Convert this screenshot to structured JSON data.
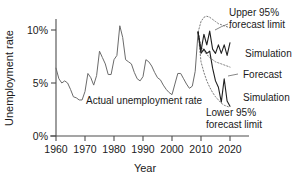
{
  "chart_data": {
    "type": "line",
    "title": "",
    "xlabel": "Year",
    "ylabel": "Unemployment rate",
    "xlim": [
      1958,
      2025
    ],
    "ylim": [
      0,
      11.6
    ],
    "grid": false,
    "legend_position": "inline-annotations",
    "x_tick_labels": [
      "1960",
      "1970",
      "1980",
      "1990",
      "2000",
      "2010",
      "2020"
    ],
    "x_ticks": [
      1960,
      1970,
      1980,
      1990,
      2000,
      2010,
      2020
    ],
    "y_tick_labels": [
      "0%",
      "5%",
      "10%"
    ],
    "y_ticks": [
      0,
      5,
      10
    ],
    "series": [
      {
        "name": "Actual unemployment rate",
        "style": "solid-gray",
        "x": [
          1960,
          1961,
          1962,
          1963,
          1964,
          1965,
          1966,
          1967,
          1968,
          1969,
          1970,
          1971,
          1972,
          1973,
          1974,
          1975,
          1976,
          1977,
          1978,
          1979,
          1980,
          1981,
          1982,
          1983,
          1984,
          1985,
          1986,
          1987,
          1988,
          1989,
          1990,
          1991,
          1992,
          1993,
          1994,
          1995,
          1996,
          1997,
          1998,
          1999,
          2000,
          2001,
          2002,
          2003,
          2004,
          2005,
          2006,
          2007,
          2008,
          2009
        ],
        "values": [
          6.4,
          5.4,
          5.0,
          5.2,
          5.0,
          4.4,
          3.7,
          3.6,
          3.4,
          3.4,
          4.2,
          5.9,
          5.5,
          4.8,
          5.7,
          8.0,
          7.4,
          6.8,
          5.8,
          5.8,
          7.2,
          7.6,
          10.4,
          9.3,
          7.2,
          7.0,
          6.8,
          6.0,
          5.4,
          5.2,
          5.6,
          7.2,
          7.0,
          6.6,
          6.0,
          5.5,
          5.3,
          4.8,
          4.4,
          4.1,
          3.9,
          4.9,
          5.9,
          5.9,
          5.4,
          4.9,
          4.5,
          4.7,
          6.1,
          9.8
        ]
      },
      {
        "name": "Simulation",
        "style": "solid-black-upper",
        "x": [
          2009,
          2010,
          2011,
          2012,
          2013,
          2014,
          2015,
          2016,
          2017,
          2018,
          2019,
          2020
        ],
        "values": [
          9.8,
          8.0,
          9.6,
          8.6,
          9.9,
          8.2,
          7.8,
          8.6,
          7.8,
          8.6,
          7.6,
          8.8
        ]
      },
      {
        "name": "Simulation",
        "style": "solid-black-lower",
        "x": [
          2009,
          2010,
          2011,
          2012,
          2013,
          2014,
          2015,
          2016,
          2017,
          2018,
          2019,
          2020
        ],
        "values": [
          9.8,
          7.8,
          8.2,
          7.8,
          8.0,
          6.4,
          5.2,
          4.6,
          3.2,
          5.4,
          3.3,
          2.8
        ]
      },
      {
        "name": "Forecast",
        "style": "dotted",
        "x": [
          2009,
          2010,
          2011,
          2012,
          2013,
          2014,
          2015,
          2016,
          2017,
          2018,
          2019,
          2020
        ],
        "values": [
          9.8,
          8.4,
          8.0,
          7.7,
          7.4,
          7.2,
          7.0,
          6.9,
          6.8,
          6.7,
          6.6,
          6.5
        ]
      },
      {
        "name": "Upper 95% forecast limit",
        "style": "dotted",
        "x": [
          2009,
          2010,
          2011,
          2012,
          2013,
          2014,
          2015,
          2016,
          2017,
          2018,
          2019,
          2020
        ],
        "values": [
          9.8,
          10.8,
          11.2,
          11.3,
          11.2,
          11.0,
          10.8,
          10.6,
          10.5,
          10.4,
          10.3,
          10.2
        ]
      },
      {
        "name": "Lower 95% forecast limit",
        "style": "dotted",
        "x": [
          2009,
          2010,
          2011,
          2012,
          2013,
          2014,
          2015,
          2016,
          2017,
          2018,
          2019,
          2020
        ],
        "values": [
          9.8,
          7.0,
          6.0,
          5.2,
          4.6,
          4.1,
          3.7,
          3.4,
          3.1,
          2.9,
          2.8,
          2.7
        ]
      }
    ],
    "annotations": [
      {
        "id": "actual",
        "text": "Actual unemployment rate"
      },
      {
        "id": "upper_limit",
        "line1": "Upper 95%",
        "line2": "forecast limit"
      },
      {
        "id": "lower_limit",
        "line1": "Lower 95%",
        "line2": "forecast limit"
      },
      {
        "id": "sim_upper",
        "text": "Simulation"
      },
      {
        "id": "sim_lower",
        "text": "Simulation"
      },
      {
        "id": "forecast",
        "text": "Forecast"
      }
    ]
  },
  "axes": {
    "y_title": "Unemployment rate",
    "x_title": "Year",
    "y_labels": [
      "10%",
      "5%",
      "0%"
    ],
    "x_labels": [
      "1960",
      "1970",
      "1980",
      "1990",
      "2000",
      "2010",
      "2020"
    ]
  },
  "annotations": {
    "actual": "Actual unemployment rate",
    "upper_limit_l1": "Upper 95%",
    "upper_limit_l2": "forecast limit",
    "lower_limit_l1": "Lower 95%",
    "lower_limit_l2": "forecast limit",
    "simulation_upper": "Simulation",
    "simulation_lower": "Simulation",
    "forecast": "Forecast"
  },
  "colors": {
    "actual_line": "#6b6b6b",
    "simulation_line": "#1f1f1f",
    "limit_line": "#7a7a7a",
    "axis": "#4d4d4d",
    "text": "#1a1a1a",
    "background": "#ffffff"
  }
}
